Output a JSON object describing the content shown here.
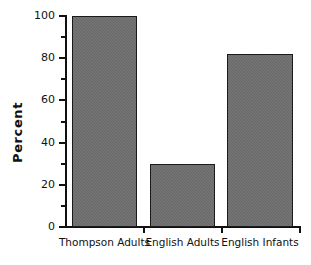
{
  "chart_data": {
    "type": "bar",
    "title": "",
    "xlabel": "",
    "ylabel": "Percent",
    "categories": [
      "Thompson Adults",
      "English Adults",
      "English Infants"
    ],
    "values": [
      100,
      30,
      82
    ],
    "ylim": [
      0,
      100
    ],
    "y_major_ticks": [
      0,
      20,
      40,
      60,
      80,
      100
    ],
    "y_minor_ticks": [
      10,
      30,
      50,
      70,
      90
    ],
    "y_tick_labels": [
      "0",
      "20",
      "40",
      "60",
      "80",
      "100"
    ],
    "grid": false,
    "legend": null,
    "legend_position": "none",
    "bar_fill_color": "#6e6e6e",
    "bar_border_color": "#1a1a1a",
    "axis_color": "#111111",
    "background_color": "#ffffff"
  }
}
